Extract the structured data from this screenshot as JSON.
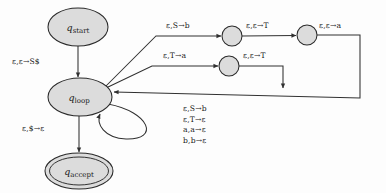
{
  "diagram": {
    "kind": "pushdown-automaton-state-diagram",
    "states": [
      {
        "id": "q_start",
        "label": "q",
        "subscript": "start",
        "shape": "ellipse",
        "accepting": false,
        "cx": 78,
        "cy": 27,
        "rx": 30,
        "ry": 19
      },
      {
        "id": "q_loop",
        "label": "q",
        "subscript": "loop",
        "shape": "ellipse",
        "accepting": false,
        "cx": 80,
        "cy": 97,
        "rx": 32,
        "ry": 19
      },
      {
        "id": "q_accept",
        "label": "q",
        "subscript": "accept",
        "shape": "ellipse",
        "accepting": true,
        "cx": 79,
        "cy": 171,
        "rx": 34,
        "ry": 18
      },
      {
        "id": "n1",
        "label": "",
        "subscript": "",
        "shape": "circle",
        "accepting": false,
        "cx": 232,
        "cy": 36,
        "rx": 10,
        "ry": 10
      },
      {
        "id": "n2",
        "label": "",
        "subscript": "",
        "shape": "circle",
        "accepting": false,
        "cx": 307,
        "cy": 35,
        "rx": 10,
        "ry": 10
      },
      {
        "id": "n3",
        "label": "",
        "subscript": "",
        "shape": "circle",
        "accepting": false,
        "cx": 229,
        "cy": 66,
        "rx": 10,
        "ry": 10
      }
    ],
    "transitions": [
      {
        "id": "t-start-loop",
        "from": "q_start",
        "to": "q_loop",
        "label": "ε,ε→S$",
        "read": "ε",
        "pop": "ε",
        "push": "S$"
      },
      {
        "id": "t-loop-n1",
        "from": "q_loop",
        "to": "n1",
        "label": "ε,S→b",
        "read": "ε",
        "pop": "S",
        "push": "b"
      },
      {
        "id": "t-n1-n2",
        "from": "n1",
        "to": "n2",
        "label": "ε,ε→T",
        "read": "ε",
        "pop": "ε",
        "push": "T"
      },
      {
        "id": "t-n2-loop",
        "from": "n2",
        "to": "q_loop",
        "label": "ε,ε→a",
        "read": "ε",
        "pop": "ε",
        "push": "a"
      },
      {
        "id": "t-loop-n3",
        "from": "q_loop",
        "to": "n3",
        "label": "ε,T→a",
        "read": "ε",
        "pop": "T",
        "push": "a"
      },
      {
        "id": "t-n3-loop",
        "from": "n3",
        "to": "q_loop",
        "label": "ε,ε→T",
        "read": "ε",
        "pop": "ε",
        "push": "T"
      },
      {
        "id": "t-loop-accept",
        "from": "q_loop",
        "to": "q_accept",
        "label": "ε,$→ε",
        "read": "ε",
        "pop": "$",
        "push": "ε"
      }
    ],
    "self_loop": {
      "id": "t-loop-self",
      "from": "q_loop",
      "to": "q_loop",
      "labels": [
        "ε,S→b",
        "ε,T→ε",
        "a,a→ε",
        "b,b→ε"
      ]
    },
    "colors": {
      "state_fill": "#dcdcdc",
      "state_stroke": "#2a2a2a",
      "edge_stroke": "#303030",
      "text": "#151515",
      "background": "#fdfdfd"
    }
  }
}
